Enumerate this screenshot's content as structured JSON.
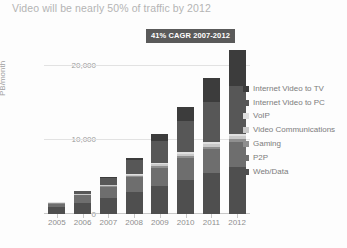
{
  "chart_data": {
    "type": "bar",
    "subtype": "stacked-column",
    "title": "Video will be nearly 50% of traffic by 2012",
    "xlabel": "",
    "ylabel": "PB/month",
    "categories": [
      "2005",
      "2006",
      "2007",
      "2008",
      "2009",
      "2010",
      "2011",
      "2012"
    ],
    "ytick_labels": [
      "0",
      "10,000",
      "20,000"
    ],
    "ytick_values": [
      0,
      10000,
      20000
    ],
    "ylim": [
      0,
      22000
    ],
    "grid": true,
    "legend_position": "right",
    "annotations": [
      {
        "text": "41% CAGR 2007-2012",
        "style": "dark-badge"
      }
    ],
    "series": [
      {
        "name": "Web/Data",
        "color": "#4f4f4f",
        "values": [
          900,
          1500,
          2100,
          2900,
          3700,
          4600,
          5500,
          6300
        ]
      },
      {
        "name": "P2P",
        "color": "#6e6e6e",
        "values": [
          500,
          1000,
          1500,
          2000,
          2500,
          2900,
          3200,
          3300
        ]
      },
      {
        "name": "Gaming",
        "color": "#8f8f8f",
        "values": [
          60,
          90,
          130,
          180,
          230,
          290,
          340,
          400
        ]
      },
      {
        "name": "Video Communications",
        "color": "#c9c9c9",
        "values": [
          40,
          70,
          110,
          160,
          220,
          300,
          380,
          470
        ]
      },
      {
        "name": "VoIP",
        "color": "#e0e0e0",
        "values": [
          60,
          90,
          120,
          150,
          180,
          210,
          240,
          270
        ]
      },
      {
        "name": "Internet Video to PC",
        "color": "#575757",
        "values": [
          100,
          350,
          900,
          1800,
          3000,
          4200,
          5400,
          6400
        ]
      },
      {
        "name": "Internet Video to TV",
        "color": "#3c3c3c",
        "values": [
          20,
          50,
          120,
          350,
          900,
          1900,
          3200,
          4900
        ]
      }
    ],
    "legend_order": [
      "Internet Video to TV",
      "Internet Video to PC",
      "VoIP",
      "Video Communications",
      "Gaming",
      "P2P",
      "Web/Data"
    ],
    "stack_order_bottom_to_top": [
      "Web/Data",
      "P2P",
      "Gaming",
      "Video Communications",
      "VoIP",
      "Internet Video to PC",
      "Internet Video to TV"
    ]
  }
}
